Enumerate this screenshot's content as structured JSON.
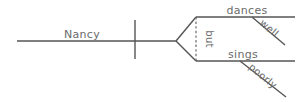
{
  "diagram": {
    "type": "sentence-diagram",
    "style": "reed-kellogg",
    "sentence": "Nancy dances well but sings poorly",
    "ink_color": "#555555",
    "text_color": "#6b6b6b",
    "background_color": "#ffffff",
    "subject": {
      "label": "Nancy"
    },
    "conjunction": {
      "label": "but",
      "orientation": "vertical-rotated"
    },
    "branches": [
      {
        "verb": "dances",
        "modifier": "well"
      },
      {
        "verb": "sings",
        "modifier": "poorly"
      }
    ]
  }
}
